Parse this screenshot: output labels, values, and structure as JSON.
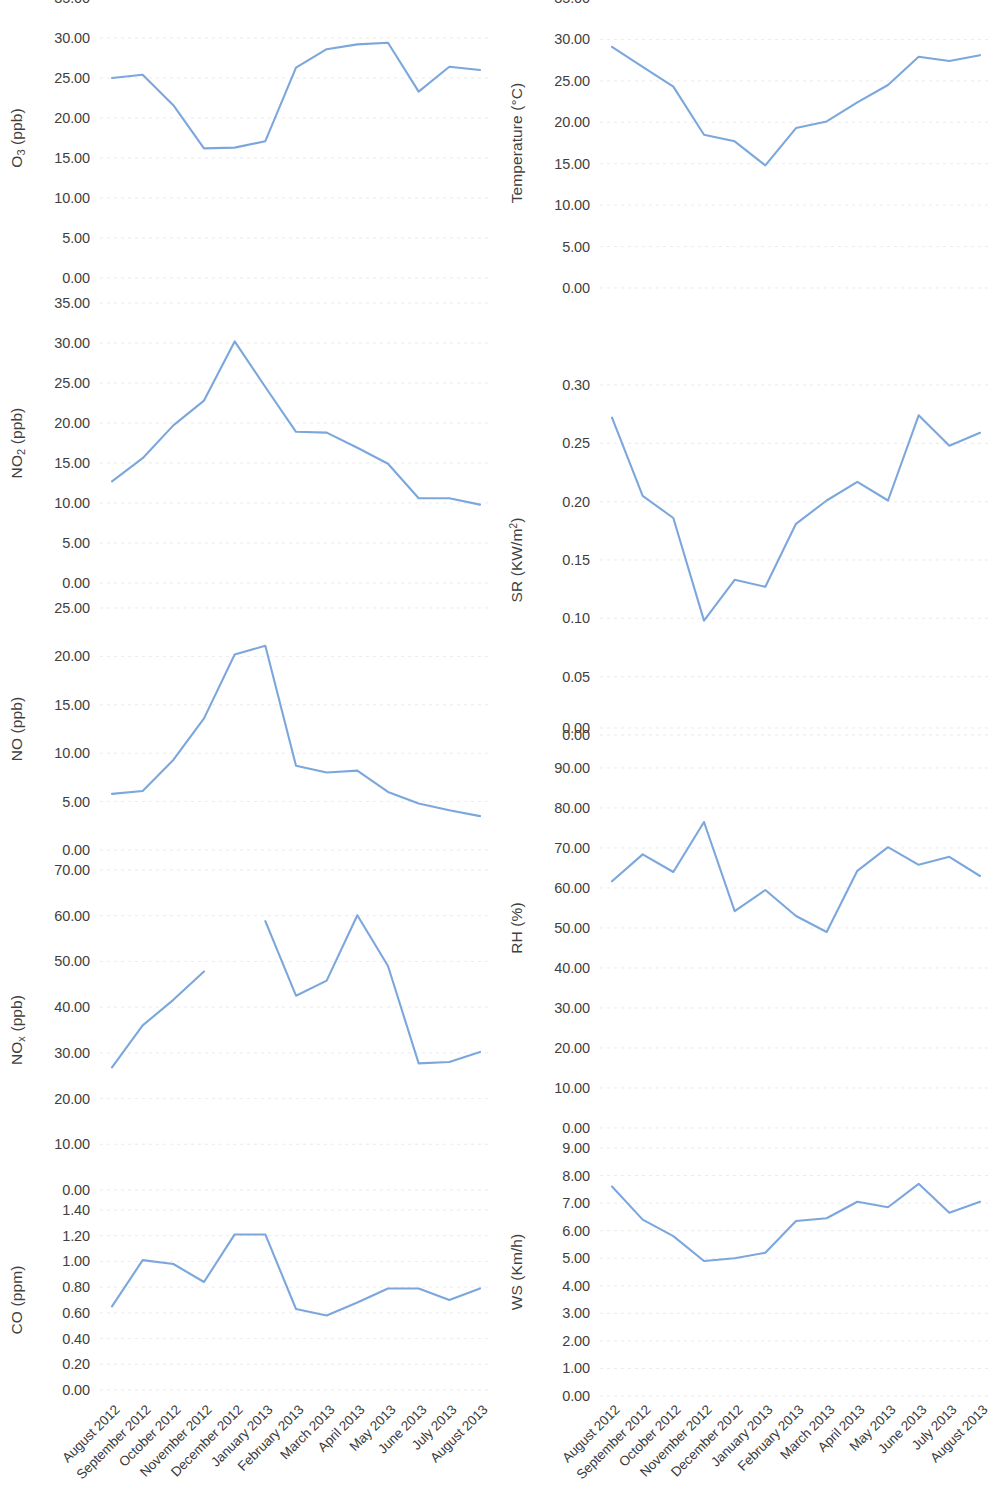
{
  "figure": {
    "categories": [
      "August 2012",
      "September 2012",
      "October 2012",
      "November 2012",
      "December 2012",
      "January 2013",
      "February 2013",
      "March 2013",
      "April 2013",
      "May 2013",
      "June 2013",
      "July 2013",
      "August 2013"
    ],
    "line_color": "#7BA7DD",
    "grid_color": "#DEDEDE"
  },
  "chart_data": [
    {
      "id": "o3",
      "type": "line",
      "title": "",
      "ylabel": "O₃ (ppb)",
      "ylabel_html": "O<sub>3</sub> (ppb)",
      "xlabel": "",
      "categories": [
        "August 2012",
        "September 2012",
        "October 2012",
        "November 2012",
        "December 2012",
        "January 2013",
        "February 2013",
        "March 2013",
        "April 2013",
        "May 2013",
        "June 2013",
        "July 2013",
        "August 2013"
      ],
      "values": [
        25.0,
        25.4,
        21.6,
        16.2,
        16.3,
        17.1,
        26.3,
        28.6,
        29.2,
        29.4,
        23.3,
        26.4,
        26.0
      ],
      "ylim": [
        0,
        35
      ],
      "yticks": [
        "0.00",
        "5.00",
        "10.00",
        "15.00",
        "20.00",
        "25.00",
        "30.00",
        "35.00"
      ],
      "ytick_values": [
        0,
        5,
        10,
        15,
        20,
        25,
        30,
        35
      ],
      "grid": true,
      "legend": "none"
    },
    {
      "id": "no2",
      "type": "line",
      "title": "",
      "ylabel": "NO₂ (ppb)",
      "ylabel_html": "NO<sub>2</sub> (ppb)",
      "xlabel": "",
      "categories": [
        "August 2012",
        "September 2012",
        "October 2012",
        "November 2012",
        "December 2012",
        "January 2013",
        "February 2013",
        "March 2013",
        "April 2013",
        "May 2013",
        "June 2013",
        "July 2013",
        "August 2013"
      ],
      "values": [
        12.7,
        15.6,
        19.7,
        22.8,
        30.2,
        24.5,
        18.9,
        18.8,
        16.9,
        14.9,
        10.6,
        10.6,
        9.8
      ],
      "ylim": [
        0,
        35
      ],
      "yticks": [
        "0.00",
        "5.00",
        "10.00",
        "15.00",
        "20.00",
        "25.00",
        "30.00",
        "35.00"
      ],
      "ytick_values": [
        0,
        5,
        10,
        15,
        20,
        25,
        30,
        35
      ],
      "grid": true,
      "legend": "none"
    },
    {
      "id": "no",
      "type": "line",
      "title": "",
      "ylabel": "NO (ppb)",
      "ylabel_html": "NO (ppb)",
      "xlabel": "",
      "categories": [
        "August 2012",
        "September 2012",
        "October 2012",
        "November 2012",
        "December 2012",
        "January 2013",
        "February 2013",
        "March 2013",
        "April 2013",
        "May 2013",
        "June 2013",
        "July 2013",
        "August 2013"
      ],
      "values": [
        5.8,
        6.1,
        9.3,
        13.6,
        20.2,
        21.1,
        8.7,
        8.0,
        8.2,
        6.0,
        4.8,
        4.1,
        3.5
      ],
      "ylim": [
        0,
        25
      ],
      "yticks": [
        "0.00",
        "5.00",
        "10.00",
        "15.00",
        "20.00",
        "25.00"
      ],
      "ytick_values": [
        0,
        5,
        10,
        15,
        20,
        25
      ],
      "grid": true,
      "legend": "none"
    },
    {
      "id": "nox",
      "type": "line",
      "title": "",
      "ylabel": "NOₓ (ppb)",
      "ylabel_html": "NO<sub>x</sub> (ppb)",
      "xlabel": "",
      "categories": [
        "August 2012",
        "September 2012",
        "October 2012",
        "November 2012",
        "December 2012",
        "January 2013",
        "February 2013",
        "March 2013",
        "April 2013",
        "May 2013",
        "June 2013",
        "July 2013",
        "August 2013"
      ],
      "values": [
        26.8,
        36.0,
        41.6,
        47.8,
        null,
        58.8,
        42.5,
        45.8,
        60.1,
        49.0,
        27.7,
        28.0,
        30.2
      ],
      "note": "January 2013 value missing (gap in line)",
      "ylim": [
        0,
        70
      ],
      "yticks": [
        "0.00",
        "10.00",
        "20.00",
        "30.00",
        "40.00",
        "50.00",
        "60.00",
        "70.00"
      ],
      "ytick_values": [
        0,
        10,
        20,
        30,
        40,
        50,
        60,
        70
      ],
      "grid": true,
      "legend": "none"
    },
    {
      "id": "co",
      "type": "line",
      "title": "",
      "ylabel": "CO (ppm)",
      "ylabel_html": "CO (ppm)",
      "xlabel": "",
      "categories": [
        "August 2012",
        "September 2012",
        "October 2012",
        "November 2012",
        "December 2012",
        "January 2013",
        "February 2013",
        "March 2013",
        "April 2013",
        "May 2013",
        "June 2013",
        "July 2013",
        "August 2013"
      ],
      "values": [
        0.65,
        1.01,
        0.98,
        0.84,
        1.21,
        1.21,
        0.63,
        0.58,
        0.68,
        0.79,
        0.79,
        0.7,
        0.79
      ],
      "ylim": [
        0,
        1.4
      ],
      "yticks": [
        "0.00",
        "0.20",
        "0.40",
        "0.60",
        "0.80",
        "1.00",
        "1.20",
        "1.40"
      ],
      "ytick_values": [
        0,
        0.2,
        0.4,
        0.6,
        0.8,
        1.0,
        1.2,
        1.4
      ],
      "grid": true,
      "legend": "none"
    },
    {
      "id": "temperature",
      "type": "line",
      "title": "",
      "ylabel": "Temperature (°C)",
      "ylabel_html": "Temperature (&deg;C)",
      "xlabel": "",
      "categories": [
        "August 2012",
        "September 2012",
        "October 2012",
        "November 2012",
        "December 2012",
        "January 2013",
        "February 2013",
        "March 2013",
        "April 2013",
        "May 2013",
        "June 2013",
        "July 2013",
        "August 2013"
      ],
      "values": [
        29.1,
        26.7,
        24.3,
        18.5,
        17.7,
        14.8,
        19.3,
        20.1,
        22.4,
        24.5,
        27.9,
        27.4,
        28.1
      ],
      "ylim": [
        0,
        35
      ],
      "yticks": [
        "0.00",
        "5.00",
        "10.00",
        "15.00",
        "20.00",
        "25.00",
        "30.00",
        "35.00"
      ],
      "ytick_values": [
        0,
        5,
        10,
        15,
        20,
        25,
        30,
        35
      ],
      "grid": true,
      "legend": "none"
    },
    {
      "id": "sr",
      "type": "line",
      "title": "",
      "ylabel": "SR (KW/m²)",
      "ylabel_html": "SR (KW/m<sup>2</sup>)",
      "xlabel": "",
      "categories": [
        "August 2012",
        "September 2012",
        "October 2012",
        "November 2012",
        "December 2012",
        "January 2013",
        "February 2013",
        "March 2013",
        "April 2013",
        "May 2013",
        "June 2013",
        "July 2013",
        "August 2013"
      ],
      "values": [
        0.272,
        0.205,
        0.186,
        0.098,
        0.133,
        0.127,
        0.181,
        0.201,
        0.217,
        0.201,
        0.274,
        0.248,
        0.259
      ],
      "ylim": [
        0,
        0.3
      ],
      "yticks": [
        "0.00",
        "0.05",
        "0.10",
        "0.15",
        "0.20",
        "0.25",
        "0.30"
      ],
      "ytick_values": [
        0,
        0.05,
        0.1,
        0.15,
        0.2,
        0.25,
        0.3
      ],
      "grid": true,
      "legend": "none"
    },
    {
      "id": "rh",
      "type": "line",
      "title": "",
      "ylabel": "RH (%)",
      "ylabel_html": "RH (%)",
      "xlabel": "",
      "categories": [
        "August 2012",
        "September 2012",
        "October 2012",
        "November 2012",
        "December 2012",
        "January 2013",
        "February 2013",
        "March 2013",
        "April 2013",
        "May 2013",
        "June 2013",
        "July 2013",
        "August 2013"
      ],
      "values": [
        61.7,
        68.4,
        64.0,
        76.5,
        54.2,
        59.5,
        53.0,
        49.0,
        64.3,
        70.2,
        65.8,
        67.8,
        63.0
      ],
      "ylim": [
        0,
        100
      ],
      "yticks": [
        "0.00",
        "10.00",
        "20.00",
        "30.00",
        "40.00",
        "50.00",
        "60.00",
        "70.00",
        "80.00",
        "90.00",
        "0.00"
      ],
      "ytick_values": [
        0,
        10,
        20,
        30,
        40,
        50,
        60,
        70,
        80,
        90,
        100
      ],
      "grid": true,
      "legend": "none"
    },
    {
      "id": "ws",
      "type": "line",
      "title": "",
      "ylabel": "WS (Km/h)",
      "ylabel_html": "WS (Km/h)",
      "xlabel": "",
      "categories": [
        "August 2012",
        "September 2012",
        "October 2012",
        "November 2012",
        "December 2012",
        "January 2013",
        "February 2013",
        "March 2013",
        "April 2013",
        "May 2013",
        "June 2013",
        "July 2013",
        "August 2013"
      ],
      "values": [
        7.6,
        6.4,
        5.8,
        4.9,
        5.0,
        5.2,
        6.35,
        6.45,
        7.05,
        6.85,
        7.7,
        6.65,
        7.05
      ],
      "ylim": [
        0,
        9
      ],
      "yticks": [
        "0.00",
        "1.00",
        "2.00",
        "3.00",
        "4.00",
        "5.00",
        "6.00",
        "7.00",
        "8.00",
        "9.00"
      ],
      "ytick_values": [
        0,
        1,
        2,
        3,
        4,
        5,
        6,
        7,
        8,
        9
      ],
      "grid": true,
      "legend": "none"
    }
  ],
  "layout": {
    "left_panels": [
      "o3",
      "no2",
      "no",
      "nox",
      "co"
    ],
    "right_panels": [
      "temperature",
      "sr",
      "rh",
      "ws"
    ],
    "left_geometry": [
      {
        "id": "o3",
        "top": -12,
        "height": 300
      },
      {
        "id": "no2",
        "top": 293,
        "height": 300
      },
      {
        "id": "no",
        "top": 598,
        "height": 262
      },
      {
        "id": "nox",
        "top": 860,
        "height": 340
      },
      {
        "id": "co",
        "top": 1200,
        "height": 200
      }
    ],
    "right_geometry": [
      {
        "id": "temperature",
        "top": -12,
        "height": 310
      },
      {
        "id": "sr",
        "top": 375,
        "height": 370
      },
      {
        "id": "rh",
        "top": 718,
        "height": 420
      },
      {
        "id": "ws",
        "top": 1138,
        "height": 268
      }
    ],
    "xaxis_top": 1398
  }
}
